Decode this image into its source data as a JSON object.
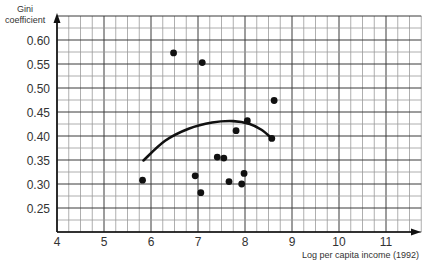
{
  "chart_data": {
    "type": "scatter",
    "title": "",
    "xlabel": "Log per capita income (1992)",
    "ylabel": "Gini coefficient",
    "ylabel_lines": [
      "Gini",
      "coefficient"
    ],
    "xlim": [
      4,
      11.75
    ],
    "ylim": [
      0.2,
      0.65
    ],
    "grid": true,
    "x_ticks": [
      4,
      5,
      6,
      7,
      8,
      9,
      10,
      11
    ],
    "y_ticks": [
      0.25,
      0.3,
      0.35,
      0.4,
      0.45,
      0.5,
      0.55,
      0.6
    ],
    "y_tick_labels": [
      "0.25",
      "0.30",
      "0.35",
      "0.40",
      "0.45",
      "0.50",
      "0.55",
      "0.60"
    ],
    "legend": null,
    "series": [
      {
        "name": "Countries",
        "kind": "scatter",
        "points": [
          {
            "x": 5.82,
            "y": 0.308
          },
          {
            "x": 6.48,
            "y": 0.573
          },
          {
            "x": 6.94,
            "y": 0.317
          },
          {
            "x": 7.06,
            "y": 0.282
          },
          {
            "x": 7.09,
            "y": 0.553
          },
          {
            "x": 7.41,
            "y": 0.356
          },
          {
            "x": 7.55,
            "y": 0.354
          },
          {
            "x": 7.66,
            "y": 0.305
          },
          {
            "x": 7.81,
            "y": 0.411
          },
          {
            "x": 7.93,
            "y": 0.3
          },
          {
            "x": 7.98,
            "y": 0.322
          },
          {
            "x": 8.05,
            "y": 0.432
          },
          {
            "x": 8.57,
            "y": 0.395
          },
          {
            "x": 8.62,
            "y": 0.474
          }
        ]
      },
      {
        "name": "Fitted curve (Kuznets)",
        "kind": "line",
        "points": [
          {
            "x": 5.84,
            "y": 0.349
          },
          {
            "x": 6.3,
            "y": 0.39
          },
          {
            "x": 6.8,
            "y": 0.415
          },
          {
            "x": 7.3,
            "y": 0.428
          },
          {
            "x": 7.75,
            "y": 0.431
          },
          {
            "x": 8.1,
            "y": 0.425
          },
          {
            "x": 8.35,
            "y": 0.413
          },
          {
            "x": 8.55,
            "y": 0.397
          }
        ]
      }
    ]
  }
}
